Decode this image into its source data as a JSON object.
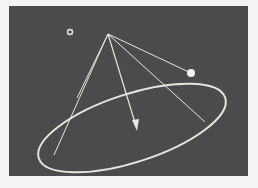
{
  "scene": {
    "background": "#4b4b4b",
    "line_color": "#e8e8e0",
    "apex": {
      "x": 108,
      "y": 34
    },
    "control_point": {
      "x": 191,
      "y": 73
    },
    "small_marker": {
      "x": 70,
      "y": 32
    },
    "ellipse": {
      "cx": 132,
      "cy": 128,
      "rx": 98,
      "ry": 34,
      "rotate": -18
    },
    "arrow_tip": {
      "x": 136,
      "y": 130
    }
  }
}
